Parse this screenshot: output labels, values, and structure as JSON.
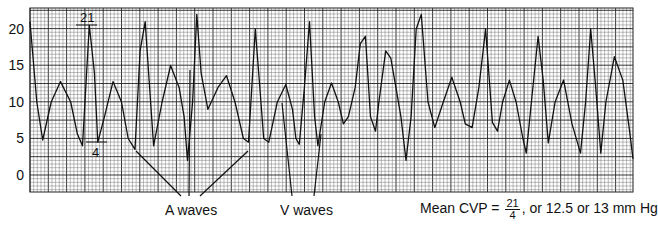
{
  "chart_data": {
    "type": "line",
    "title": "",
    "xlabel": "",
    "ylabel": "",
    "ylim": [
      -3,
      22.5
    ],
    "grid": true,
    "yticks": [
      0,
      5,
      10,
      15,
      20
    ],
    "legend": null,
    "series": [
      {
        "name": "CVP waveform",
        "points": [
          [
            0,
            21
          ],
          [
            8,
            10
          ],
          [
            15,
            4.8
          ],
          [
            25,
            10
          ],
          [
            36,
            12.8
          ],
          [
            48,
            10
          ],
          [
            56,
            5.6
          ],
          [
            62,
            4
          ],
          [
            70,
            20.5
          ],
          [
            76,
            14
          ],
          [
            80,
            4.5
          ],
          [
            88,
            8
          ],
          [
            98,
            12.8
          ],
          [
            108,
            10
          ],
          [
            116,
            5
          ],
          [
            124,
            3.5
          ],
          [
            130,
            17
          ],
          [
            136,
            21
          ],
          [
            140,
            14
          ],
          [
            146,
            4
          ],
          [
            156,
            10
          ],
          [
            166,
            15
          ],
          [
            176,
            12
          ],
          [
            182,
            8
          ],
          [
            186,
            2
          ],
          [
            192,
            10
          ],
          [
            197,
            22
          ],
          [
            202,
            14
          ],
          [
            210,
            9
          ],
          [
            222,
            12
          ],
          [
            232,
            13.6
          ],
          [
            242,
            10
          ],
          [
            252,
            5
          ],
          [
            258,
            4.5
          ],
          [
            266,
            20
          ],
          [
            270,
            14
          ],
          [
            276,
            5
          ],
          [
            282,
            4.5
          ],
          [
            292,
            10
          ],
          [
            302,
            12.4
          ],
          [
            310,
            9
          ],
          [
            314,
            5
          ],
          [
            318,
            4.2
          ],
          [
            324,
            12
          ],
          [
            330,
            21
          ],
          [
            336,
            8
          ],
          [
            340,
            4
          ],
          [
            348,
            10
          ],
          [
            356,
            12.6
          ],
          [
            364,
            10
          ],
          [
            370,
            7
          ],
          [
            376,
            8
          ],
          [
            384,
            12
          ],
          [
            390,
            18
          ],
          [
            396,
            19
          ],
          [
            402,
            8
          ],
          [
            408,
            6
          ],
          [
            412,
            10
          ],
          [
            420,
            17
          ],
          [
            426,
            16
          ],
          [
            432,
            12
          ],
          [
            438,
            8
          ],
          [
            444,
            2
          ],
          [
            450,
            8
          ],
          [
            456,
            20
          ],
          [
            462,
            22
          ],
          [
            470,
            10
          ],
          [
            478,
            6.5
          ],
          [
            488,
            10
          ],
          [
            498,
            13.4
          ],
          [
            508,
            10
          ],
          [
            514,
            7
          ],
          [
            522,
            6.5
          ],
          [
            530,
            12
          ],
          [
            538,
            20
          ],
          [
            546,
            7.2
          ],
          [
            552,
            6
          ],
          [
            558,
            10
          ],
          [
            566,
            13
          ],
          [
            574,
            10
          ],
          [
            582,
            5
          ],
          [
            586,
            3
          ],
          [
            592,
            10
          ],
          [
            600,
            19
          ],
          [
            606,
            13
          ],
          [
            612,
            4.4
          ],
          [
            620,
            10
          ],
          [
            630,
            13
          ],
          [
            640,
            7
          ],
          [
            650,
            3
          ],
          [
            656,
            10
          ],
          [
            662,
            20
          ],
          [
            668,
            12
          ],
          [
            674,
            3
          ],
          [
            680,
            10
          ],
          [
            690,
            16.2
          ],
          [
            700,
            13
          ],
          [
            708,
            6
          ],
          [
            712,
            2.2
          ]
        ]
      }
    ],
    "annotations": [
      {
        "text": "21",
        "type": "peak-marker",
        "value": 21
      },
      {
        "text": "4",
        "type": "trough-marker",
        "value": 4
      },
      {
        "text": "A waves",
        "type": "callout"
      },
      {
        "text": "V waves",
        "type": "callout"
      },
      {
        "text": "Mean CVP = 21/4, or 12.5 or 13 mm Hg",
        "type": "caption"
      }
    ]
  },
  "axis": {
    "yticks": [
      "20",
      "15",
      "10",
      "5",
      "0"
    ]
  },
  "annotations": {
    "peak_value": "21",
    "trough_value": "4",
    "a_waves_label": "A waves",
    "v_waves_label": "V waves",
    "mean_prefix": "Mean CVP =",
    "mean_num": "21",
    "mean_den": "4",
    "mean_suffix": ", or 12.5 or 13 mm Hg"
  },
  "colors": {
    "trace": "#111111",
    "grid_minor": "#6b6b6b",
    "grid_major": "#222222",
    "background": "#ffffff"
  }
}
